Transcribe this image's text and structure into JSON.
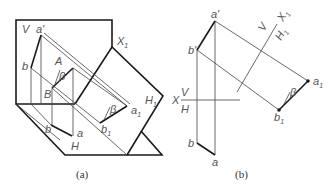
{
  "figure_a": {
    "caption": "(a)",
    "labels": {
      "V": "V",
      "a_prime": "a'",
      "b": "b",
      "A": "A",
      "beta_top": "β",
      "B": "B",
      "X1": "X",
      "X1_sub": "1",
      "H1": "H",
      "H1_sub": "1",
      "beta_right": "β",
      "a1": "a",
      "a1_sub": "1",
      "b1": "b",
      "b1_sub": "1",
      "b_h": "b",
      "a_h": "a",
      "H": "H"
    }
  },
  "figure_b": {
    "caption": "(b)",
    "labels": {
      "a_prime": "a'",
      "b_prime": "b'",
      "X": "X",
      "V": "V",
      "H": "H",
      "V1": "V",
      "H1": "H",
      "H1_sub": "1",
      "X1": "X",
      "X1_sub": "1",
      "a1": "a",
      "a1_sub": "1",
      "b1": "b",
      "b1_sub": "1",
      "beta": "β",
      "b": "b",
      "a": "a"
    }
  },
  "colors": {
    "line": "#1a1a1a",
    "thin_line": "#444444",
    "label": "#555555",
    "background": "#ffffff"
  }
}
